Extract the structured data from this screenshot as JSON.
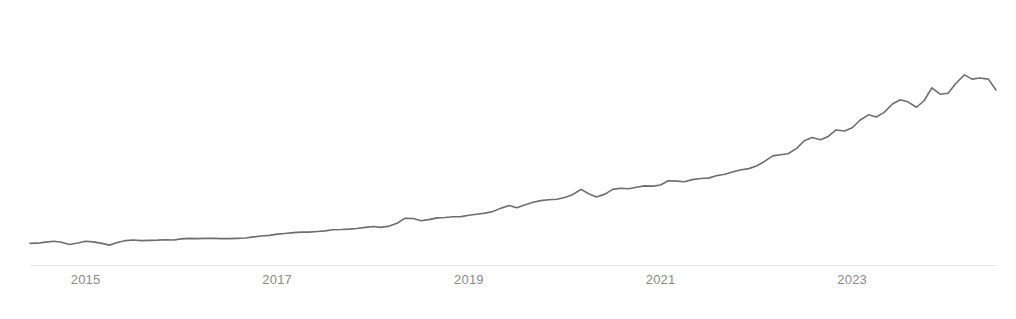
{
  "chart_data": {
    "type": "line",
    "title": "",
    "subtitle": "",
    "xlabel": "",
    "ylabel": "",
    "grid": false,
    "legend": "none",
    "axis_color": "#e6e6e6",
    "line_color": "#6e6e6e",
    "tick_label_color": "#8a8a8a",
    "background_color": "#ffffff",
    "xlim": [
      2014.42,
      2024.5
    ],
    "ylim": [
      0,
      118
    ],
    "xticks": [
      2015,
      2017,
      2019,
      2021,
      2023
    ],
    "xtick_labels": [
      "2015",
      "2017",
      "2019",
      "2021",
      "2023"
    ],
    "yticks": [],
    "ytick_labels": [],
    "series": [
      {
        "name": "series-1",
        "color": "#6e6e6e",
        "x": [
          2014.42,
          2014.5,
          2014.58,
          2014.67,
          2014.75,
          2014.83,
          2014.92,
          2015.0,
          2015.08,
          2015.17,
          2015.25,
          2015.33,
          2015.42,
          2015.5,
          2015.58,
          2015.67,
          2015.75,
          2015.83,
          2015.92,
          2016.0,
          2016.08,
          2016.17,
          2016.25,
          2016.33,
          2016.42,
          2016.5,
          2016.58,
          2016.67,
          2016.75,
          2016.83,
          2016.92,
          2017.0,
          2017.08,
          2017.17,
          2017.25,
          2017.33,
          2017.42,
          2017.5,
          2017.58,
          2017.67,
          2017.75,
          2017.83,
          2017.92,
          2018.0,
          2018.08,
          2018.17,
          2018.25,
          2018.33,
          2018.42,
          2018.5,
          2018.58,
          2018.67,
          2018.75,
          2018.83,
          2018.92,
          2019.0,
          2019.08,
          2019.17,
          2019.25,
          2019.33,
          2019.42,
          2019.5,
          2019.58,
          2019.67,
          2019.75,
          2019.83,
          2019.92,
          2020.0,
          2020.08,
          2020.17,
          2020.25,
          2020.33,
          2020.42,
          2020.5,
          2020.58,
          2020.67,
          2020.75,
          2020.83,
          2020.92,
          2021.0,
          2021.08,
          2021.17,
          2021.25,
          2021.33,
          2021.42,
          2021.5,
          2021.58,
          2021.67,
          2021.75,
          2021.83,
          2021.92,
          2022.0,
          2022.08,
          2022.17,
          2022.25,
          2022.33,
          2022.42,
          2022.5,
          2022.58,
          2022.67,
          2022.75,
          2022.83,
          2022.92,
          2023.0,
          2023.08,
          2023.17,
          2023.25,
          2023.33,
          2023.42,
          2023.5,
          2023.58,
          2023.67,
          2023.75,
          2023.83,
          2023.92,
          2024.0,
          2024.08,
          2024.17,
          2024.25,
          2024.33,
          2024.42,
          2024.5
        ],
        "values": [
          10.0,
          10.1,
          10.6,
          11.0,
          10.5,
          9.5,
          10.2,
          11.0,
          10.7,
          10.0,
          9.2,
          10.4,
          11.3,
          11.6,
          11.3,
          11.4,
          11.5,
          11.7,
          11.6,
          12.1,
          12.3,
          12.2,
          12.3,
          12.3,
          12.2,
          12.2,
          12.3,
          12.5,
          13.0,
          13.4,
          13.7,
          14.3,
          14.6,
          15.0,
          15.2,
          15.2,
          15.5,
          15.8,
          16.3,
          16.4,
          16.6,
          16.9,
          17.4,
          17.8,
          17.4,
          18.0,
          19.3,
          21.6,
          21.5,
          20.5,
          21.0,
          21.8,
          22.0,
          22.3,
          22.4,
          23.0,
          23.5,
          24.0,
          24.8,
          26.2,
          27.5,
          26.5,
          27.8,
          29.0,
          29.8,
          30.2,
          30.4,
          31.2,
          32.5,
          35.0,
          33.0,
          31.5,
          32.8,
          35.0,
          35.5,
          35.3,
          36.0,
          36.6,
          36.5,
          37.0,
          39.0,
          38.8,
          38.5,
          39.5,
          40.0,
          40.2,
          41.3,
          42.0,
          43.0,
          44.0,
          44.6,
          45.8,
          47.8,
          50.5,
          51.0,
          51.5,
          54.0,
          57.5,
          59.0,
          58.0,
          59.5,
          62.5,
          62.0,
          63.5,
          67.0,
          69.5,
          68.5,
          70.5,
          74.5,
          76.5,
          75.5,
          73.0,
          76.0,
          82.0,
          79.0,
          79.5,
          84.0,
          88.0,
          86.0,
          86.5,
          86.0,
          81.0
        ]
      }
    ],
    "annotations": []
  },
  "axis": {
    "baseline_present": true
  }
}
